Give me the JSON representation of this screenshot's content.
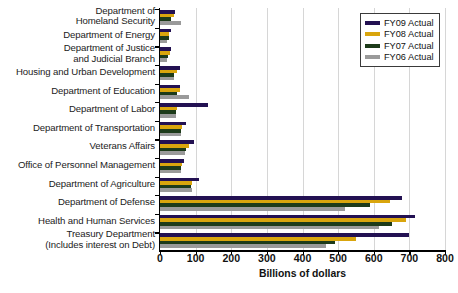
{
  "chart_data": {
    "type": "bar",
    "orientation": "horizontal",
    "title": "",
    "xlabel": "Billions of dollars",
    "ylabel": "",
    "xlim": [
      0,
      800
    ],
    "xticks": [
      0,
      100,
      200,
      300,
      400,
      500,
      600,
      700,
      800
    ],
    "grid": true,
    "legend_position": "top-right",
    "categories": [
      "Department of\nHomeland Security",
      "Department of Energy",
      "Department of Justice\nand Judicial Branch",
      "Housing and Urban Development",
      "Department of Education",
      "Department of Labor",
      "Department of Transportation",
      "Veterans Affairs",
      "Office of Personnel Management",
      "Department of Agriculture",
      "Department of Defense",
      "Health and Human Services",
      "Treasury Department\n(Includes interest on Debt)"
    ],
    "series": [
      {
        "name": "FY09 Actual",
        "color": "#231152",
        "values": [
          42,
          30,
          32,
          57,
          55,
          135,
          72,
          95,
          68,
          110,
          680,
          715,
          700
        ]
      },
      {
        "name": "FY08 Actual",
        "color": "#d9a50d",
        "values": [
          38,
          26,
          28,
          48,
          55,
          48,
          62,
          82,
          63,
          90,
          645,
          690,
          550
        ]
      },
      {
        "name": "FY07 Actual",
        "color": "#1d3b1a",
        "values": [
          32,
          24,
          23,
          40,
          48,
          45,
          58,
          72,
          60,
          88,
          590,
          650,
          490
        ]
      },
      {
        "name": "FY06 Actual",
        "color": "#9a9a9a",
        "values": [
          60,
          21,
          21,
          40,
          80,
          44,
          58,
          70,
          58,
          90,
          520,
          615,
          465
        ]
      }
    ]
  }
}
